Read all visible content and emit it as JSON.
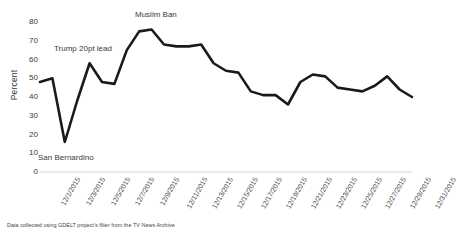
{
  "chart_data": {
    "type": "line",
    "title": "",
    "xlabel": "",
    "ylabel": "Percent",
    "ylim": [
      0,
      80
    ],
    "ytick_step": 10,
    "yticks": [
      0,
      10,
      20,
      30,
      40,
      50,
      60,
      70,
      80
    ],
    "grid": false,
    "legend": "none",
    "line_color": "#1a1a1a",
    "x": [
      "12/1/2015",
      "12/2/2015",
      "12/3/2015",
      "12/4/2015",
      "12/5/2015",
      "12/6/2015",
      "12/7/2015",
      "12/8/2015",
      "12/9/2015",
      "12/10/2015",
      "12/11/2015",
      "12/12/2015",
      "12/13/2015",
      "12/14/2015",
      "12/15/2015",
      "12/16/2015",
      "12/17/2015",
      "12/18/2015",
      "12/19/2015",
      "12/20/2015",
      "12/21/2015",
      "12/22/2015",
      "12/23/2015",
      "12/24/2015",
      "12/25/2015",
      "12/26/2015",
      "12/27/2015",
      "12/28/2015",
      "12/29/2015",
      "12/30/2015",
      "12/31/2015"
    ],
    "xtick_labels": [
      "12/1/2015",
      "12/3/2015",
      "12/5/2015",
      "12/7/2015",
      "12/9/2015",
      "12/11/2015",
      "12/13/2015",
      "12/15/2015",
      "12/17/2015",
      "12/19/2015",
      "12/21/2015",
      "12/23/2015",
      "12/25/2015",
      "12/27/2015",
      "12/29/2015",
      "12/31/2015"
    ],
    "values": [
      48,
      50,
      16,
      38,
      58,
      48,
      47,
      65,
      75,
      76,
      68,
      67,
      67,
      68,
      58,
      54,
      53,
      43,
      41,
      41,
      36,
      48,
      52,
      51,
      45,
      44,
      43,
      46,
      51,
      44,
      40
    ],
    "annotations": [
      {
        "text": "Trump 20pt lead",
        "x_pixel": 54,
        "y_pixel": 44
      },
      {
        "text": "Muslim Ban",
        "x_pixel": 135,
        "y_pixel": 10
      },
      {
        "text": "San Bernardino",
        "x_pixel": 38,
        "y_pixel": 153
      }
    ],
    "footnote": "Data collected using GDELT project's filter from the TV News Archive"
  }
}
